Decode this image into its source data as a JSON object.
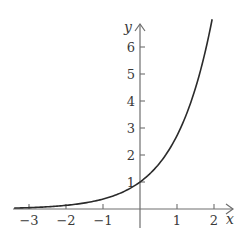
{
  "chart_data": {
    "type": "line",
    "title": "",
    "function": "y = e^x",
    "xlabel": "x",
    "ylabel": "y",
    "xlim": [
      -3.4,
      2.6
    ],
    "ylim": [
      -0.7,
      7.0
    ],
    "grid": false,
    "legend": null,
    "x_ticks": [
      -3,
      -2,
      -1,
      1,
      2
    ],
    "x_tick_labels": [
      "−3",
      "−2",
      "−1",
      "1",
      "2"
    ],
    "y_ticks": [
      1,
      2,
      3,
      4,
      5,
      6
    ],
    "y_tick_labels": [
      "1",
      "2",
      "3",
      "4",
      "5",
      "6"
    ],
    "series": [
      {
        "name": "e^x",
        "x": [
          -3.4,
          -3,
          -2.5,
          -2,
          -1.5,
          -1,
          -0.5,
          0,
          0.5,
          1,
          1.25,
          1.5,
          1.75,
          1.95
        ],
        "y": [
          0.033,
          0.05,
          0.082,
          0.135,
          0.223,
          0.368,
          0.607,
          1.0,
          1.649,
          2.718,
          3.49,
          4.482,
          5.755,
          7.029
        ]
      }
    ],
    "annotations": []
  },
  "layout": {
    "origin_px": [
      140,
      209
    ],
    "unit_x_px": 37,
    "unit_y_px": 27
  }
}
